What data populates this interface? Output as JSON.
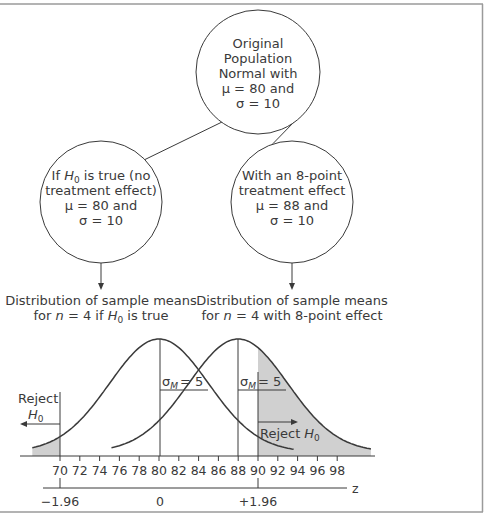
{
  "diagram": {
    "top_node": {
      "lines": [
        "Original",
        "Population",
        "Normal with",
        "μ = 80 and",
        "σ = 10"
      ]
    },
    "left_node": {
      "line1_prefix": "If ",
      "line1_H": "H",
      "line1_sub": "0",
      "line1_suffix": " is true (no",
      "lines": [
        "treatment effect)",
        "μ = 80 and",
        "σ = 10"
      ]
    },
    "right_node": {
      "lines": [
        "With an 8-point",
        "treatment effect",
        "μ = 88 and",
        "σ = 10"
      ]
    },
    "left_caption": {
      "line1": "Distribution of sample means",
      "line2_prefix": "for ",
      "line2_n": "n",
      "line2_mid": " = 4 if ",
      "line2_H": "H",
      "line2_sub": "0",
      "line2_suffix": " is true"
    },
    "right_caption": {
      "line1": "Distribution of sample means",
      "line2_prefix": "for ",
      "line2_n": "n",
      "line2_suffix": " = 4 with 8-point effect"
    }
  },
  "chart_data": {
    "type": "area",
    "title": "",
    "xlabel": "",
    "ylabel": "",
    "x_ticks": [
      70,
      72,
      74,
      76,
      78,
      80,
      82,
      84,
      86,
      88,
      90,
      92,
      94,
      96,
      98
    ],
    "z_axis": {
      "label": "z",
      "ticks": [
        {
          "value": -1.96,
          "label": "−1.96",
          "x": 70
        },
        {
          "value": 0,
          "label": "0",
          "x": 80
        },
        {
          "value": 1.96,
          "label": "+1.96",
          "x": 90
        }
      ]
    },
    "series": [
      {
        "name": "H0 true distribution",
        "mean": 80,
        "sd": 5,
        "shaded_region": "x < 70"
      },
      {
        "name": "8-point effect distribution",
        "mean": 88,
        "sd": 5,
        "shaded_region": "x > 90"
      }
    ],
    "annotations": [
      {
        "text": "σM = 5",
        "sigma": "σ",
        "sub": "M",
        "value": "= 5",
        "series": 0
      },
      {
        "text": "σM = 5",
        "sigma": "σ",
        "sub": "M",
        "value": "= 5",
        "series": 1
      },
      {
        "text": "Reject H0",
        "side": "left",
        "reject": "Reject",
        "H": "H",
        "sub": "0"
      },
      {
        "text": "Reject H0",
        "side": "right",
        "reject": "Reject",
        "H": "H",
        "sub": "0"
      }
    ],
    "critical_values": [
      70,
      90
    ],
    "grid": false
  },
  "colors": {
    "line": "#3a3a3a",
    "shade": "#d0d0d0",
    "frame": "#9a9a9a"
  }
}
